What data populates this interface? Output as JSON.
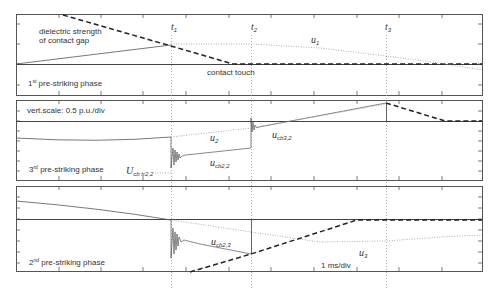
{
  "figure": {
    "panels": [
      {
        "id": "panel-1",
        "phase_label": {
          "ordinal": "1",
          "suffix": "st",
          "text": " pre-striking phase"
        },
        "annotations": {
          "dielectric_line1": "dielectric strength",
          "dielectric_line2": "of contact gap",
          "contact_touch": "contact touch",
          "u_symbol": "u",
          "u_sub": "1"
        }
      },
      {
        "id": "panel-2",
        "phase_label": {
          "ordinal": "3",
          "suffix": "rd",
          "text": " pre-striking phase"
        },
        "annotations": {
          "vert_scale": "vert.scale: 0.5 p.u./div",
          "u2_symbol": "u",
          "u2_sub": "2",
          "ucb22_symbol": "u",
          "ucb22_sub": "cb2,2",
          "ucb32_symbol": "u",
          "ucb32_sub": "cb3,2",
          "Ucbtr22_symbol": "U",
          "Ucbtr22_sub": "cb tr2,2"
        }
      },
      {
        "id": "panel-3",
        "phase_label": {
          "ordinal": "2",
          "suffix": "nd",
          "text": " pre-striking phase"
        },
        "annotations": {
          "ucb23_symbol": "u",
          "ucb23_sub": "cb2,3",
          "u3_symbol": "u",
          "u3_sub": "3",
          "time_scale": "1 ms/div"
        }
      }
    ],
    "time_markers": [
      {
        "symbol": "t",
        "sub": "1"
      },
      {
        "symbol": "t",
        "sub": "2"
      },
      {
        "symbol": "t",
        "sub": "3"
      }
    ],
    "colors": {
      "axis": "#444444",
      "trace": "#666666",
      "dashed": "#222222",
      "dotted": "#9a9a9a"
    }
  }
}
